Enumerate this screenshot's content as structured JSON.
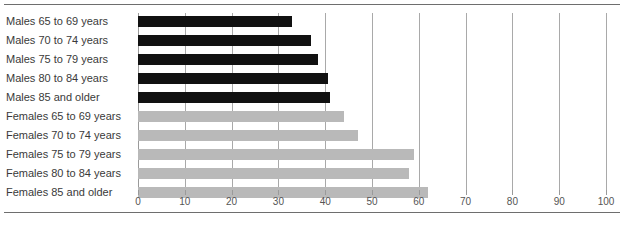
{
  "chart_data": {
    "type": "bar",
    "title": "",
    "subtitle": "",
    "xlabel": "",
    "ylabel": "",
    "orientation": "horizontal",
    "xlim": [
      0,
      100
    ],
    "xticks": [
      0,
      10,
      20,
      30,
      40,
      50,
      60,
      70,
      80,
      90,
      100
    ],
    "xtick_labels": [
      "0",
      "10",
      "20",
      "30",
      "40",
      "50",
      "60",
      "70",
      "80",
      "90",
      "100"
    ],
    "grid": true,
    "legend": "none",
    "categories": [
      "Males 65 to 69 years",
      "Males 70 to 74 years",
      "Males 75 to 79 years",
      "Males 80 to 84 years",
      "Males 85 and older",
      "Females 65 to 69 years",
      "Females 70 to 74 years",
      "Females 75 to 79 years",
      "Females 80 to 84 years",
      "Females 85 and older"
    ],
    "values": [
      33,
      37,
      38.5,
      40.5,
      41,
      44,
      47,
      59,
      58,
      62
    ],
    "bar_groups": [
      {
        "name": "Males",
        "color": "#111111",
        "indices": [
          0,
          1,
          2,
          3,
          4
        ]
      },
      {
        "name": "Females",
        "color": "#b9b9b9",
        "indices": [
          5,
          6,
          7,
          8,
          9
        ]
      }
    ]
  },
  "colors": {
    "male_bar": "#111111",
    "female_bar": "#b9b9b9",
    "gridline": "#a9a9a9",
    "rule": "#6e6e6e",
    "label_text": "#3a3a3a",
    "tick_text": "#555555",
    "background": "#ffffff"
  }
}
